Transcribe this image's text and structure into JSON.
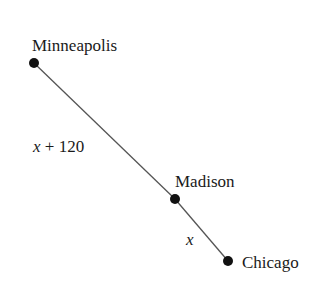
{
  "diagram": {
    "nodes": [
      {
        "id": "minneapolis",
        "label": "Minneapolis",
        "x": 34,
        "y": 63
      },
      {
        "id": "madison",
        "label": "Madison",
        "x": 175,
        "y": 199
      },
      {
        "id": "chicago",
        "label": "Chicago",
        "x": 228,
        "y": 261
      }
    ],
    "edges": [
      {
        "from": "minneapolis",
        "to": "madison",
        "label": "x + 120"
      },
      {
        "from": "madison",
        "to": "chicago",
        "label": "x"
      }
    ],
    "colors": {
      "line": "#555555",
      "dot": "#111111",
      "text": "#1a1a1a"
    }
  }
}
